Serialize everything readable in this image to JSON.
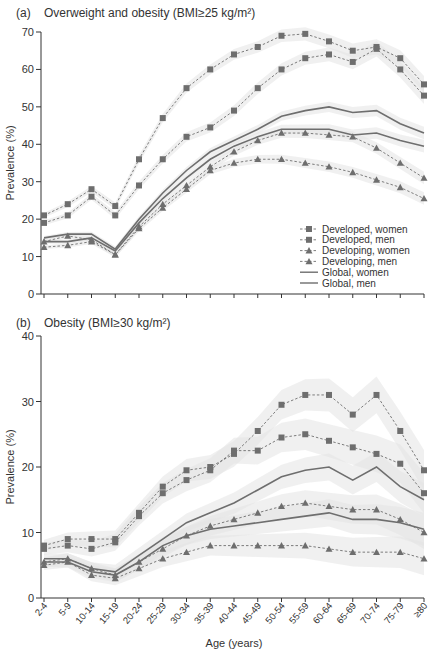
{
  "figure": {
    "xlabel": "Age (years)",
    "categories": [
      "2-4",
      "5-9",
      "10-14",
      "15-19",
      "20-24",
      "25-29",
      "30-34",
      "35-39",
      "40-44",
      "45-49",
      "50-54",
      "55-59",
      "60-64",
      "65-69",
      "70-74",
      "75-79",
      "≥80"
    ]
  },
  "legend": {
    "items": [
      {
        "label": "Developed, women",
        "marker": "square",
        "line": "dashed"
      },
      {
        "label": "Developed, men",
        "marker": "square",
        "line": "dashed"
      },
      {
        "label": "Developing, women",
        "marker": "triangle",
        "line": "dashed"
      },
      {
        "label": "Developing, men",
        "marker": "triangle",
        "line": "dashed"
      },
      {
        "label": "Global, women",
        "marker": "none",
        "line": "solid"
      },
      {
        "label": "Global, men",
        "marker": "none",
        "line": "solid"
      }
    ]
  },
  "colors": {
    "series": "#6e6e6e",
    "band": "#e3e3e3",
    "axis": "#333333"
  },
  "chart_data": [
    {
      "type": "line",
      "panel_label": "(a)",
      "title": "Overweight and obesity (BMI≥25 kg/m²)",
      "xlabel": "Age (years)",
      "ylabel": "Prevalence (%)",
      "ylim": [
        0,
        70
      ],
      "yticks": [
        0,
        10,
        20,
        30,
        40,
        50,
        60,
        70
      ],
      "grid": false,
      "legend_position": "lower right",
      "categories": [
        "2-4",
        "5-9",
        "10-14",
        "15-19",
        "20-24",
        "25-29",
        "30-34",
        "35-39",
        "40-44",
        "45-49",
        "50-54",
        "55-59",
        "60-64",
        "65-69",
        "70-74",
        "75-79",
        "≥80"
      ],
      "series": [
        {
          "name": "Developed, women",
          "values": [
            21,
            24,
            28,
            23.5,
            36,
            47,
            55,
            60,
            64,
            66,
            69,
            69.5,
            67.5,
            65,
            66,
            63,
            56
          ]
        },
        {
          "name": "Developed, men",
          "values": [
            19,
            21,
            26,
            21,
            29,
            36,
            42,
            44.5,
            49,
            55,
            60,
            63,
            64,
            62,
            65.5,
            60,
            53
          ]
        },
        {
          "name": "Developing, women",
          "values": [
            14,
            15.5,
            14.5,
            10.5,
            18,
            24,
            29,
            34,
            38,
            41,
            43,
            43,
            42.5,
            42,
            39,
            35,
            31
          ]
        },
        {
          "name": "Developing, men",
          "values": [
            12.5,
            13,
            14,
            10.5,
            17.5,
            23,
            28,
            33,
            35,
            36,
            36,
            35,
            34,
            32.5,
            30.5,
            28.5,
            25.5
          ]
        },
        {
          "name": "Global, women",
          "values": [
            15,
            16,
            16,
            12,
            20,
            27,
            33,
            38,
            41,
            44,
            47.5,
            49,
            50,
            48.5,
            49,
            45.5,
            43
          ]
        },
        {
          "name": "Global, men",
          "values": [
            14,
            14,
            15,
            11.5,
            19,
            25.5,
            31,
            36,
            39.5,
            42,
            44,
            44,
            44,
            42.5,
            43,
            41,
            39.5
          ]
        }
      ]
    },
    {
      "type": "line",
      "panel_label": "(b)",
      "title": "Obesity (BMI≥30 kg/m²)",
      "xlabel": "Age (years)",
      "ylabel": "Prevalence (%)",
      "ylim": [
        0,
        40
      ],
      "yticks": [
        0,
        10,
        20,
        30,
        40
      ],
      "grid": false,
      "categories": [
        "2-4",
        "5-9",
        "10-14",
        "15-19",
        "20-24",
        "25-29",
        "30-34",
        "35-39",
        "40-44",
        "45-49",
        "50-54",
        "55-59",
        "60-64",
        "65-69",
        "70-74",
        "75-79",
        "≥80"
      ],
      "series": [
        {
          "name": "Developed, women",
          "values": [
            8,
            9,
            9,
            9,
            13,
            17,
            19.5,
            20,
            22,
            25.5,
            29.5,
            31,
            31,
            28,
            31,
            25.5,
            19.5
          ]
        },
        {
          "name": "Developed, men",
          "values": [
            7.5,
            8,
            7.5,
            8.5,
            12.5,
            16,
            18,
            19.5,
            22.5,
            22.5,
            24.5,
            25,
            24,
            23,
            22,
            20.5,
            16
          ]
        },
        {
          "name": "Developing, women",
          "values": [
            5.5,
            6,
            4.5,
            3.5,
            5.5,
            7.5,
            9.5,
            11,
            12,
            13,
            14,
            14.5,
            14,
            13.5,
            13.5,
            12,
            10
          ]
        },
        {
          "name": "Developing, men",
          "values": [
            5,
            5.5,
            3.5,
            3,
            4.5,
            6,
            7,
            8,
            8,
            8,
            8,
            8,
            7.5,
            7,
            7,
            7,
            6
          ]
        },
        {
          "name": "Global, women",
          "values": [
            6,
            6,
            4.5,
            4,
            6.5,
            9,
            11.5,
            13,
            14.5,
            16.5,
            18.5,
            19.5,
            20,
            18,
            20,
            17,
            15
          ]
        },
        {
          "name": "Global, men",
          "values": [
            5.5,
            5.5,
            4,
            3.5,
            5.5,
            8,
            9.5,
            10.5,
            11,
            11.5,
            12,
            12.5,
            13,
            12,
            12,
            11.5,
            10.5
          ]
        }
      ]
    }
  ]
}
